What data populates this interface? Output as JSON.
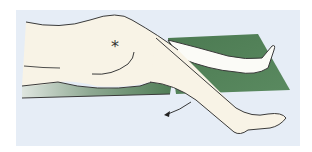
{
  "figure": {
    "type": "medical-illustration",
    "marker_symbol": "*",
    "colors": {
      "background": "#e6edf6",
      "skin": "#f8f3e6",
      "support": "#4f7d55",
      "outline": "#3a3a3a"
    }
  }
}
